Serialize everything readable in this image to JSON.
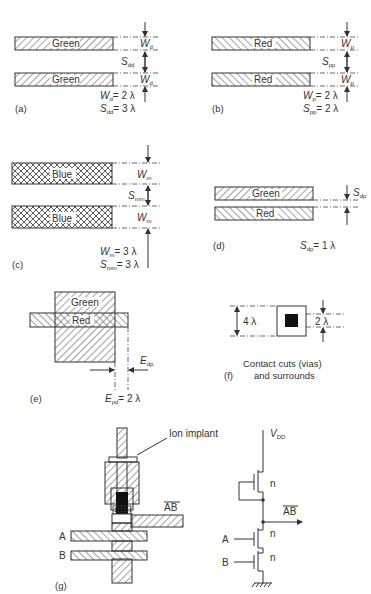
{
  "figure": {
    "panels": {
      "a": {
        "caption": "(a)",
        "layer_label": "Green",
        "width_symbol": "W",
        "width_sub": "d",
        "space_symbol": "S",
        "space_sub": "dd",
        "rule_width": "= 2 λ",
        "rule_space": "= 3 λ"
      },
      "b": {
        "caption": "(b)",
        "layer_label": "Red",
        "width_symbol": "W",
        "width_sub": "p",
        "space_symbol": "S",
        "space_sub": "pp",
        "rule_width": "= 2 λ",
        "rule_space": "= 2 λ"
      },
      "c": {
        "caption": "(c)",
        "layer_label": "Blue",
        "width_symbol": "W",
        "width_sub": "m",
        "space_symbol": "S",
        "space_sub": "mm",
        "rule_width": "= 3 λ",
        "rule_space": "= 3 λ"
      },
      "d": {
        "caption": "(d)",
        "top_label": "Green",
        "bottom_label": "Red",
        "space_symbol": "S",
        "space_sub": "dp",
        "rule_space": "= 1 λ"
      },
      "e": {
        "caption": "(e)",
        "top_label": "Green",
        "poly_label": "Red",
        "ext_symbol": "E",
        "ext_sub": "dp",
        "rule_symbol": "E",
        "rule_sub": "pd",
        "rule_value": "= 2 λ"
      },
      "f": {
        "caption": "(f)",
        "outer_dim": "4 λ",
        "inner_dim": "2 λ",
        "description_line1": "Contact cuts (vias)",
        "description_line2": "and surrounds"
      },
      "g": {
        "caption": "(g)",
        "implant_label": "Ion implant",
        "input_a": "A",
        "input_b": "B",
        "output": "AB",
        "vdd_symbol": "V",
        "vdd_sub": "DD",
        "transistor_type": "n"
      }
    }
  },
  "colors": {
    "ink": "#333333",
    "background": "#ffffff",
    "contact": "#111111"
  }
}
